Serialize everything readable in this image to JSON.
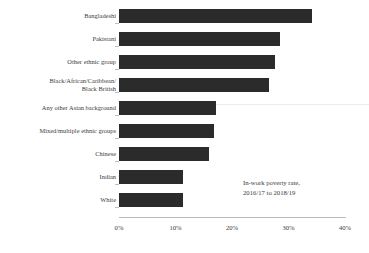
{
  "chart_data": {
    "type": "bar",
    "orientation": "horizontal",
    "title": "",
    "subtitle": "",
    "xlabel": "",
    "ylabel": "",
    "xlim": [
      0,
      40
    ],
    "xunit": "%",
    "grid": false,
    "legend": "none",
    "bar_color": "#2b2b2b",
    "annotation": {
      "lines": [
        "In-work poverty rate,",
        "2016/17 to 2018/19"
      ],
      "position": "inside-plot-bottom-right"
    },
    "xticks": [
      {
        "value": 0,
        "label": "0%"
      },
      {
        "value": 10,
        "label": "10%"
      },
      {
        "value": 20,
        "label": "20%"
      },
      {
        "value": 30,
        "label": "30%"
      },
      {
        "value": 40,
        "label": "40%"
      }
    ],
    "categories": [
      "Bangladeshi",
      "Pakistani",
      "Other ethnic group",
      "Black/African/Caribbean/ Black British",
      "Any other Asian background",
      "Mixed/multiple ethnic groups",
      "Chinese",
      "Indian",
      "White"
    ],
    "values": [
      34.2,
      34.2,
      28.5,
      27.6,
      26.5,
      17.2,
      16.8,
      15.9,
      11.3
    ],
    "bars": [
      {
        "label_line1": "Bangladeshi",
        "label_line2": "",
        "value": 34.2
      },
      {
        "label_line1": "Pakistani",
        "label_line2": "",
        "value": 34.2
      },
      {
        "label_line1": "Other ethnic group",
        "label_line2": "",
        "value": 28.5
      },
      {
        "label_line1": "Black/African/Caribbean/",
        "label_line2": "Black British",
        "value": 27.6
      },
      {
        "label_line1": "Any other Asian background",
        "label_line2": "",
        "value": 26.5
      },
      {
        "label_line1": "Mixed/multiple ethnic groups",
        "label_line2": "",
        "value": 17.2
      },
      {
        "label_line1": "Chinese",
        "label_line2": "",
        "value": 16.8
      },
      {
        "label_line1": "Indian",
        "label_line2": "",
        "value": 15.9
      },
      {
        "label_line1": "White",
        "label_line2": "",
        "value": 11.3
      }
    ]
  }
}
